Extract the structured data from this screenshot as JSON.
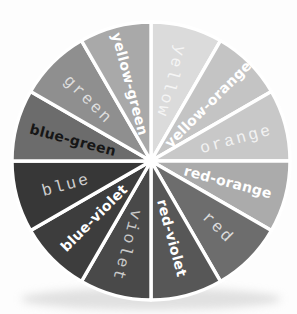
{
  "wheel": {
    "name": "color wheel",
    "background": "#fdfdfd",
    "separator_color": "#ffffff",
    "shadow_color": "#c9c9c9"
  },
  "segments": [
    {
      "label": "yellow",
      "color": "#dbdbdb",
      "text_color": "#f5f5f5"
    },
    {
      "label": "yellow-orange",
      "color": "#c4c4c4",
      "text_color": "#ffffff"
    },
    {
      "label": "orange",
      "color": "#c8c8c8",
      "text_color": "#f2f2f2"
    },
    {
      "label": "red-orange",
      "color": "#ababab",
      "text_color": "#ffffff"
    },
    {
      "label": "red",
      "color": "#6d6d6d",
      "text_color": "#dcdcdc"
    },
    {
      "label": "red-violet",
      "color": "#575757",
      "text_color": "#ffffff"
    },
    {
      "label": "violet",
      "color": "#494949",
      "text_color": "#c9c9c9"
    },
    {
      "label": "blue-violet",
      "color": "#3d3d3d",
      "text_color": "#ffffff"
    },
    {
      "label": "blue",
      "color": "#373737",
      "text_color": "#cfcfcf"
    },
    {
      "label": "blue-green",
      "color": "#6c6c6c",
      "text_color": "#161616"
    },
    {
      "label": "green",
      "color": "#8f8f8f",
      "text_color": "#dedede"
    },
    {
      "label": "yellow-green",
      "color": "#a9a9a9",
      "text_color": "#ffffff"
    }
  ]
}
